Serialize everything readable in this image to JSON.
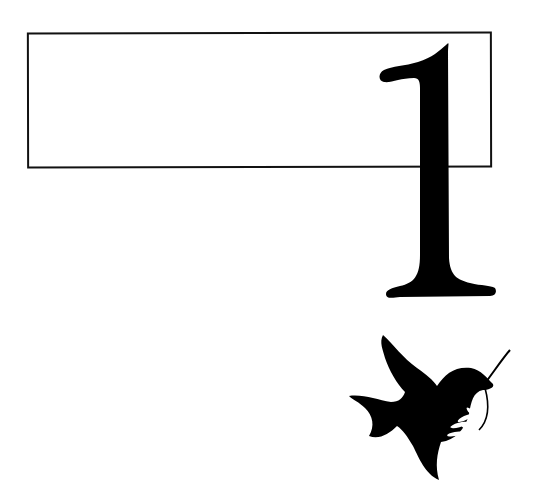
{
  "page": {
    "chapter_number": "1",
    "title_box_text": "",
    "ornament": "dove-with-olive-branch-icon",
    "colors": {
      "ink": "#000000",
      "paper": "#ffffff",
      "frame": "#111111"
    }
  }
}
